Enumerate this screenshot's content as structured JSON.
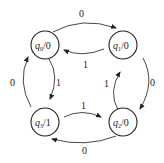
{
  "diagram": {
    "type": "moore-state-machine",
    "states": [
      {
        "id": "q0",
        "name": "q",
        "sub": "0",
        "output": "/0"
      },
      {
        "id": "q1",
        "name": "q",
        "sub": "1",
        "output": "/0"
      },
      {
        "id": "q2",
        "name": "q",
        "sub": "2",
        "output": "/0"
      },
      {
        "id": "q3",
        "name": "q",
        "sub": "3",
        "output": "/1"
      }
    ],
    "transitions": [
      {
        "from": "q0",
        "to": "q1",
        "input": "0"
      },
      {
        "from": "q1",
        "to": "q0",
        "input": "1"
      },
      {
        "from": "q1",
        "to": "q2",
        "input": "0"
      },
      {
        "from": "q2",
        "to": "q1",
        "input": "1"
      },
      {
        "from": "q2",
        "to": "q3",
        "input": "0"
      },
      {
        "from": "q3",
        "to": "q2",
        "input": "1"
      },
      {
        "from": "q3",
        "to": "q0",
        "input": "0"
      },
      {
        "from": "q0",
        "to": "q3",
        "input": "1"
      }
    ]
  }
}
